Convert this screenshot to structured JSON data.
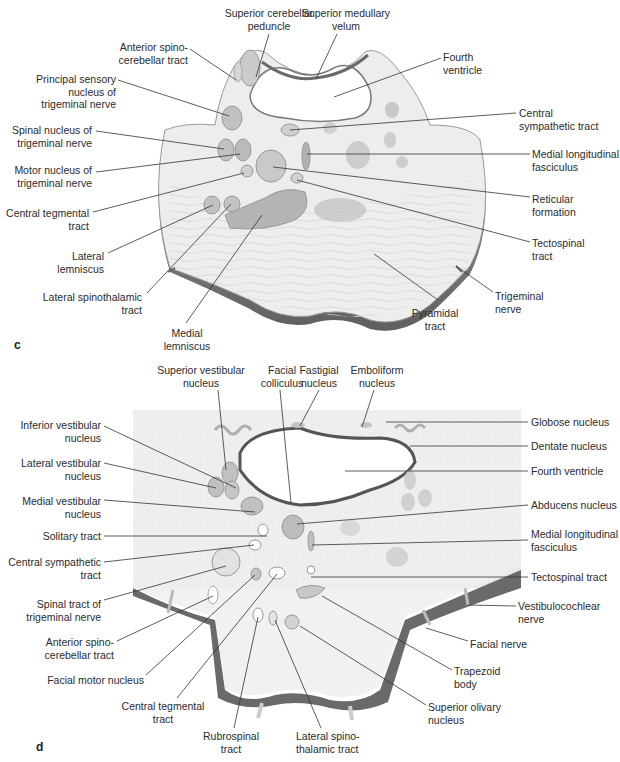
{
  "panels": [
    {
      "id": "c",
      "letter": "c",
      "labels": [
        {
          "text": "Superior cerebellar\npeduncle",
          "x": 222,
          "y": 7,
          "w": 94,
          "align": "c"
        },
        {
          "text": "Superior medullary\nvelum",
          "x": 300,
          "y": 7,
          "w": 92,
          "align": "c"
        },
        {
          "text": "Anterior spino-\ncerebellar tract",
          "x": 108,
          "y": 41,
          "w": 80,
          "align": "r"
        },
        {
          "text": "Fourth\nventricle",
          "x": 443,
          "y": 51,
          "w": 60,
          "align": "l"
        },
        {
          "text": "Principal sensory\nnucleus of\ntrigeminal nerve",
          "x": 30,
          "y": 73,
          "w": 86,
          "align": "r"
        },
        {
          "text": "Central\nsympathetic tract",
          "x": 519,
          "y": 107,
          "w": 100,
          "align": "l"
        },
        {
          "text": "Spinal nucleus of\ntrigeminal nerve",
          "x": 10,
          "y": 124,
          "w": 82,
          "align": "r"
        },
        {
          "text": "Medial longitudinal\nfasciculus",
          "x": 532,
          "y": 148,
          "w": 88,
          "align": "l"
        },
        {
          "text": "Motor nucleus of\ntrigeminal nerve",
          "x": 10,
          "y": 164,
          "w": 82,
          "align": "r"
        },
        {
          "text": "Reticular\nformation",
          "x": 532,
          "y": 193,
          "w": 70,
          "align": "l"
        },
        {
          "text": "Central tegmental\ntract",
          "x": 5,
          "y": 207,
          "w": 84,
          "align": "r"
        },
        {
          "text": "Tectospinal\ntract",
          "x": 532,
          "y": 237,
          "w": 70,
          "align": "l"
        },
        {
          "text": "Lateral\nlemniscus",
          "x": 40,
          "y": 250,
          "w": 64,
          "align": "r"
        },
        {
          "text": "Trigeminal\nnerve",
          "x": 495,
          "y": 290,
          "w": 60,
          "align": "l"
        },
        {
          "text": "Lateral spinothalamic\ntract",
          "x": 30,
          "y": 291,
          "w": 112,
          "align": "r"
        },
        {
          "text": "Medial\nlemniscus",
          "x": 155,
          "y": 327,
          "w": 64,
          "align": "c"
        },
        {
          "text": "Pyramidal\ntract",
          "x": 405,
          "y": 307,
          "w": 60,
          "align": "c"
        }
      ],
      "letter_pos": {
        "x": 14,
        "y": 338
      }
    },
    {
      "id": "d",
      "letter": "d",
      "labels": [
        {
          "text": "Superior vestibular\nnucleus",
          "x": 153,
          "y": 364,
          "w": 96,
          "align": "c"
        },
        {
          "text": "Facial\ncolliculus",
          "x": 256,
          "y": 364,
          "w": 52,
          "align": "c"
        },
        {
          "text": "Fastigial\nnucleus",
          "x": 295,
          "y": 364,
          "w": 48,
          "align": "c"
        },
        {
          "text": "Emboliform\nnucleus",
          "x": 345,
          "y": 364,
          "w": 64,
          "align": "c"
        },
        {
          "text": "Globose nucleus",
          "x": 531,
          "y": 416,
          "w": 88,
          "align": "l"
        },
        {
          "text": "Inferior vestibular\nnucleus",
          "x": 10,
          "y": 419,
          "w": 91,
          "align": "r"
        },
        {
          "text": "Dentate nucleus",
          "x": 531,
          "y": 440,
          "w": 88,
          "align": "l"
        },
        {
          "text": "Lateral vestibular\nnucleus",
          "x": 10,
          "y": 457,
          "w": 91,
          "align": "r"
        },
        {
          "text": "Fourth ventricle",
          "x": 531,
          "y": 465,
          "w": 88,
          "align": "l"
        },
        {
          "text": "Medial vestibular\nnucleus",
          "x": 10,
          "y": 495,
          "w": 91,
          "align": "r"
        },
        {
          "text": "Abducens nucleus",
          "x": 531,
          "y": 499,
          "w": 88,
          "align": "l"
        },
        {
          "text": "Solitary tract",
          "x": 10,
          "y": 530,
          "w": 91,
          "align": "r"
        },
        {
          "text": "Medial longitudinal\nfasciculus",
          "x": 531,
          "y": 528,
          "w": 88,
          "align": "l"
        },
        {
          "text": "Central sympathetic\ntract",
          "x": 5,
          "y": 556,
          "w": 96,
          "align": "r"
        },
        {
          "text": "Tectospinal tract",
          "x": 531,
          "y": 571,
          "w": 88,
          "align": "l"
        },
        {
          "text": "Spinal tract of\ntrigeminal nerve",
          "x": 10,
          "y": 598,
          "w": 91,
          "align": "r"
        },
        {
          "text": "Vestibulocochlear\nnerve",
          "x": 518,
          "y": 600,
          "w": 100,
          "align": "l"
        },
        {
          "text": "Anterior spino-\ncerebellar tract",
          "x": 20,
          "y": 636,
          "w": 94,
          "align": "r"
        },
        {
          "text": "Facial nerve",
          "x": 470,
          "y": 638,
          "w": 70,
          "align": "l"
        },
        {
          "text": "Facial motor nucleus",
          "x": 40,
          "y": 674,
          "w": 104,
          "align": "r"
        },
        {
          "text": "Trapezoid\nbody",
          "x": 454,
          "y": 665,
          "w": 60,
          "align": "l"
        },
        {
          "text": "Central tegmental\ntract",
          "x": 120,
          "y": 700,
          "w": 86,
          "align": "c"
        },
        {
          "text": "Superior olivary\nnucleus",
          "x": 428,
          "y": 701,
          "w": 84,
          "align": "l"
        },
        {
          "text": "Rubrospinal\ntract",
          "x": 196,
          "y": 730,
          "w": 70,
          "align": "c"
        },
        {
          "text": "Lateral spino-\nthalamic tract",
          "x": 296,
          "y": 730,
          "w": 80,
          "align": "l"
        }
      ],
      "letter_pos": {
        "x": 36,
        "y": 740
      }
    }
  ],
  "colors": {
    "tissue": "#ececec",
    "tissue_light": "#f4f4f4",
    "nucleus": "#b9b9b9",
    "nucleus_dark": "#a4a4a4",
    "edge": "#6f6f6f",
    "leader": "#333333"
  }
}
